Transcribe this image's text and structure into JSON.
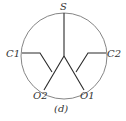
{
  "diagram": {
    "labels": {
      "top": "S",
      "left": "C1",
      "right": "C2",
      "bottom_left": "O2",
      "bottom_right": "O1"
    },
    "caption": "(d)",
    "colors": {
      "circle_stroke": "#777777",
      "line_stroke": "#2a2a2a",
      "text": "#333333",
      "background": "#ffffff"
    }
  }
}
